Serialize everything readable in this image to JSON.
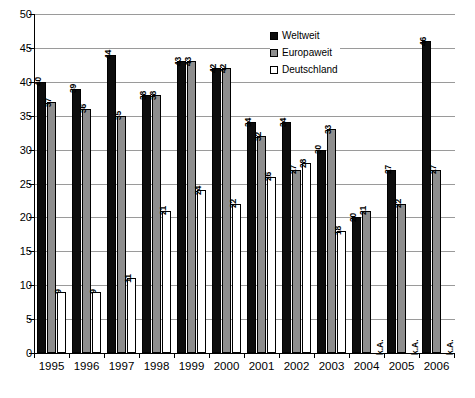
{
  "chart_data": {
    "type": "bar",
    "title": "",
    "subtitle": "",
    "xlabel": "",
    "ylabel": "",
    "ylim": [
      0,
      50
    ],
    "ytick_step": 5,
    "yticks": [
      "0",
      "5",
      "10",
      "15",
      "20",
      "25",
      "30",
      "35",
      "40",
      "45",
      "50"
    ],
    "grid": true,
    "legend_position": "top-right",
    "categories": [
      "1995",
      "1996",
      "1997",
      "1998",
      "1999",
      "2000",
      "2001",
      "2002",
      "2003",
      "2004",
      "2005",
      "2006"
    ],
    "series": [
      {
        "name": "Weltweit",
        "color": "#0d0d0d",
        "values": [
          40,
          39,
          44,
          38,
          43,
          42,
          34,
          34,
          30,
          20,
          27,
          46
        ],
        "labels": [
          "40",
          "39",
          "44",
          "38",
          "43",
          "42",
          "34",
          "34",
          "30",
          "20",
          "27",
          "46"
        ]
      },
      {
        "name": "Europaweit",
        "color": "#8e8e8e",
        "values": [
          37,
          36,
          35,
          38,
          43,
          42,
          32,
          27,
          33,
          21,
          22,
          27
        ],
        "labels": [
          "37",
          "36",
          "35",
          "38",
          "43",
          "42",
          "32",
          "27",
          "33",
          "21",
          "22",
          "27"
        ]
      },
      {
        "name": "Deutschland",
        "color": "#ffffff",
        "values": [
          9,
          9,
          11,
          21,
          24,
          22,
          26,
          28,
          18,
          null,
          null,
          null
        ],
        "labels": [
          "9",
          "9",
          "11",
          "21",
          "24",
          "22",
          "26",
          "28",
          "18",
          "k.A.",
          "k.A.",
          "k.A."
        ]
      }
    ]
  },
  "legend": {
    "items": [
      {
        "label": "Weltweit"
      },
      {
        "label": "Europaweit"
      },
      {
        "label": "Deutschland"
      }
    ]
  },
  "axes": {
    "y": {
      "min": "0",
      "max": "50"
    },
    "x": {
      "first": "1995",
      "last": "2006"
    }
  },
  "colors": {
    "weltweit": "#0d0d0d",
    "europaweit": "#8e8e8e",
    "deutschland": "#ffffff",
    "grid": "#9a9a9a",
    "axis": "#000000",
    "background": "#ffffff"
  },
  "notes": {
    "no_data_marker": "k.A."
  }
}
